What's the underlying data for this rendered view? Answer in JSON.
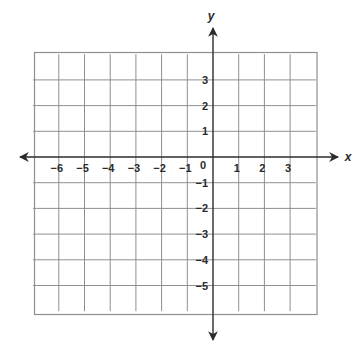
{
  "diagram": {
    "type": "coordinate-grid",
    "x_axis_label": "x",
    "y_axis_label": "y",
    "origin_label": "0",
    "x_ticks": [
      {
        "value": -6,
        "label": "−6"
      },
      {
        "value": -5,
        "label": "−5"
      },
      {
        "value": -4,
        "label": "−4"
      },
      {
        "value": -3,
        "label": "−3"
      },
      {
        "value": -2,
        "label": "−2"
      },
      {
        "value": -1,
        "label": "−1"
      },
      {
        "value": 1,
        "label": "1"
      },
      {
        "value": 2,
        "label": "2"
      },
      {
        "value": 3,
        "label": "3"
      }
    ],
    "y_ticks": [
      {
        "value": 3,
        "label": "3"
      },
      {
        "value": 2,
        "label": "2"
      },
      {
        "value": 1,
        "label": "1"
      },
      {
        "value": -1,
        "label": "−1"
      },
      {
        "value": -2,
        "label": "−2"
      },
      {
        "value": -3,
        "label": "−3"
      },
      {
        "value": -4,
        "label": "−4"
      },
      {
        "value": -5,
        "label": "−5"
      }
    ],
    "grid": {
      "x_range": [
        -7,
        4
      ],
      "y_range": [
        -6,
        4
      ],
      "unit_px": 25.7,
      "line_color": "#8f8f8f",
      "axis_color": "#2b2b2b"
    }
  }
}
